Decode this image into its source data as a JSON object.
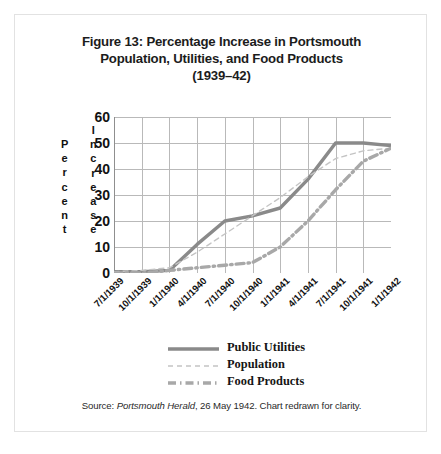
{
  "figure": {
    "title_lines": [
      "Figure 13: Percentage Increase in Portsmouth",
      "Population, Utilities, and Food Products",
      "(1939–42)"
    ],
    "source_prefix": "Source: ",
    "source_italic": "Portsmouth Herald",
    "source_suffix": ", 26 May 1942. Chart redrawn for clarity."
  },
  "axis_titles": {
    "y_primary": "Percent",
    "y_secondary": "Increase"
  },
  "colors": {
    "public_utilities": "#8a8a8a",
    "population": "#c4c4c4",
    "food_products": "#a8a8a8",
    "grid": "#b9b9b9",
    "axis": "#8f8f8f",
    "frame": "#e2e2e2",
    "text": "#1c1c1c"
  },
  "chart_data": {
    "type": "line",
    "title": "Figure 13: Percentage Increase in Portsmouth Population, Utilities, and Food Products (1939–42)",
    "xlabel": "",
    "ylabel": "Percent Increase",
    "ylim": [
      0,
      60
    ],
    "yticks": [
      0,
      10,
      20,
      30,
      40,
      50,
      60
    ],
    "grid": true,
    "legend_position": "below-plot",
    "categories": [
      "7/1/1939",
      "10/1/1939",
      "1/1/1940",
      "4/1/1940",
      "7/1/1940",
      "10/1/1940",
      "1/1/1941",
      "4/1/1941",
      "7/1/1941",
      "10/1/1941",
      "1/1/1942"
    ],
    "series": [
      {
        "name": "Public Utilities",
        "style": "solid",
        "color": "#8a8a8a",
        "values": [
          0.5,
          0.5,
          1,
          11,
          20,
          22,
          25,
          36,
          50,
          50,
          49
        ]
      },
      {
        "name": "Population",
        "style": "dashed",
        "color": "#c4c4c4",
        "values": [
          0.5,
          1,
          2,
          8,
          15,
          22,
          29,
          37,
          44,
          47,
          48
        ]
      },
      {
        "name": "Food Products",
        "style": "dash-dot",
        "color": "#a8a8a8",
        "values": [
          0,
          0,
          1,
          2,
          3,
          4,
          10,
          20,
          32,
          43,
          48
        ]
      }
    ]
  }
}
